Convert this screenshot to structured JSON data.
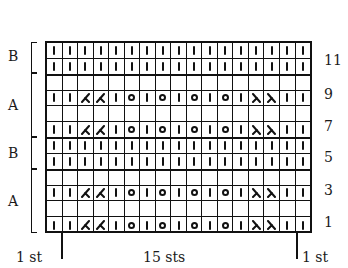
{
  "chart_data": {
    "type": "table",
    "columns": 17,
    "rows_count": 12,
    "legend_symbols": {
      "k": "knit (vertical bar)",
      "o": "yarn over (circle)",
      "k2tog": "right-leaning decrease",
      "ssk": "left-leaning decrease",
      "blank": "empty square"
    },
    "rows": [
      {
        "row": 12,
        "section": "B",
        "cells": [
          "k",
          "k",
          "k",
          "k",
          "k",
          "k",
          "k",
          "k",
          "k",
          "k",
          "k",
          "k",
          "k",
          "k",
          "k",
          "k",
          "k"
        ]
      },
      {
        "row": 11,
        "section": "B",
        "cells": [
          "k",
          "k",
          "k",
          "k",
          "k",
          "k",
          "k",
          "k",
          "k",
          "k",
          "k",
          "k",
          "k",
          "k",
          "k",
          "k",
          "k"
        ]
      },
      {
        "row": 10,
        "section": "A",
        "cells": [
          "",
          "",
          "",
          "",
          "",
          "",
          "",
          "",
          "",
          "",
          "",
          "",
          "",
          "",
          "",
          "",
          ""
        ]
      },
      {
        "row": 9,
        "section": "A",
        "cells": [
          "k",
          "k",
          "k2tog",
          "k2tog",
          "k",
          "o",
          "k",
          "o",
          "k",
          "o",
          "k",
          "o",
          "k",
          "ssk",
          "ssk",
          "k",
          "k"
        ]
      },
      {
        "row": 8,
        "section": "A",
        "cells": [
          "",
          "",
          "",
          "",
          "",
          "",
          "",
          "",
          "",
          "",
          "",
          "",
          "",
          "",
          "",
          "",
          ""
        ]
      },
      {
        "row": 7,
        "section": "A",
        "cells": [
          "k",
          "k",
          "k2tog",
          "k2tog",
          "k",
          "o",
          "k",
          "o",
          "k",
          "o",
          "k",
          "o",
          "k",
          "ssk",
          "ssk",
          "k",
          "k"
        ]
      },
      {
        "row": 6,
        "section": "B",
        "cells": [
          "k",
          "k",
          "k",
          "k",
          "k",
          "k",
          "k",
          "k",
          "k",
          "k",
          "k",
          "k",
          "k",
          "k",
          "k",
          "k",
          "k"
        ]
      },
      {
        "row": 5,
        "section": "B",
        "cells": [
          "k",
          "k",
          "k",
          "k",
          "k",
          "k",
          "k",
          "k",
          "k",
          "k",
          "k",
          "k",
          "k",
          "k",
          "k",
          "k",
          "k"
        ]
      },
      {
        "row": 4,
        "section": "A",
        "cells": [
          "",
          "",
          "",
          "",
          "",
          "",
          "",
          "",
          "",
          "",
          "",
          "",
          "",
          "",
          "",
          "",
          ""
        ]
      },
      {
        "row": 3,
        "section": "A",
        "cells": [
          "k",
          "k",
          "k2tog",
          "k2tog",
          "k",
          "o",
          "k",
          "o",
          "k",
          "o",
          "k",
          "o",
          "k",
          "ssk",
          "ssk",
          "k",
          "k"
        ]
      },
      {
        "row": 2,
        "section": "A",
        "cells": [
          "",
          "",
          "",
          "",
          "",
          "",
          "",
          "",
          "",
          "",
          "",
          "",
          "",
          "",
          "",
          "",
          ""
        ]
      },
      {
        "row": 1,
        "section": "A",
        "cells": [
          "k",
          "k",
          "k2tog",
          "k2tog",
          "k",
          "o",
          "k",
          "o",
          "k",
          "o",
          "k",
          "o",
          "k",
          "ssk",
          "ssk",
          "k",
          "k"
        ]
      }
    ],
    "row_labels": [
      "11",
      "9",
      "7",
      "5",
      "3",
      "1"
    ],
    "sections": [
      {
        "label": "B",
        "rows": "12-11"
      },
      {
        "label": "A",
        "rows": "10-7"
      },
      {
        "label": "B",
        "rows": "6-5"
      },
      {
        "label": "A",
        "rows": "4-1"
      }
    ],
    "footer": {
      "left": "1 st",
      "center": "15 sts",
      "right": "1 st"
    }
  },
  "labels": {
    "row_11": "11",
    "row_9": "9",
    "row_7": "7",
    "row_5": "5",
    "row_3": "3",
    "row_1": "1",
    "section_b1": "B",
    "section_a1": "A",
    "section_b2": "B",
    "section_a2": "A",
    "footer_left": "1 st",
    "footer_center": "15 sts",
    "footer_right": "1 st"
  }
}
